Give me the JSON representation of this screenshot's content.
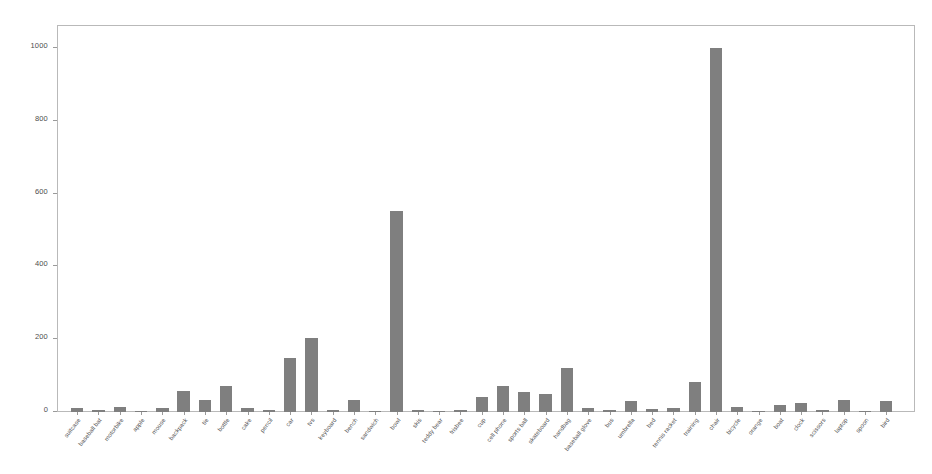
{
  "chart_data": {
    "type": "bar",
    "title": "",
    "subtitle": "",
    "xlabel": "",
    "ylabel": "",
    "ylim": [
      0,
      1060
    ],
    "xlim": [
      0,
      43
    ],
    "grid": false,
    "legend": null,
    "bar_color": "#7f7f7f",
    "axis_color": "#b9b9b9",
    "tick_label_color": "#545454",
    "y_ticks": [
      0,
      200,
      400,
      600,
      800,
      1000
    ],
    "y_tick_labels": [
      "0",
      "200",
      "400",
      "600",
      "800",
      "1000"
    ],
    "categories": [
      "suitcase",
      "baseball bat",
      "motorbike",
      "apple",
      "mouse",
      "backpack",
      "tie",
      "bottle",
      "cake",
      "pencil",
      "car",
      "tvs",
      "keyboard",
      "bench",
      "sandwich",
      "bowl",
      "skis",
      "teddy bear",
      "frisbee",
      "cup",
      "cell phone",
      "sports ball",
      "skateboard",
      "handbag",
      "baseball glove",
      "bus",
      "umbrella",
      "bed",
      "tennis racket",
      "training",
      "chair",
      "bicycle",
      "orange",
      "boat",
      "clock",
      "scissors",
      "laptop",
      "spoon",
      "bird"
    ],
    "values": [
      12,
      5,
      14,
      4,
      10,
      57,
      34,
      72,
      10,
      5,
      148,
      203,
      6,
      32,
      3,
      552,
      5,
      4,
      6,
      42,
      72,
      54,
      50,
      120,
      12,
      6,
      30,
      7,
      12,
      82,
      1000,
      14,
      4,
      20,
      26,
      5,
      32,
      4,
      30
    ]
  },
  "figure": {
    "background": "#ffffff",
    "width": 932,
    "height": 474
  }
}
